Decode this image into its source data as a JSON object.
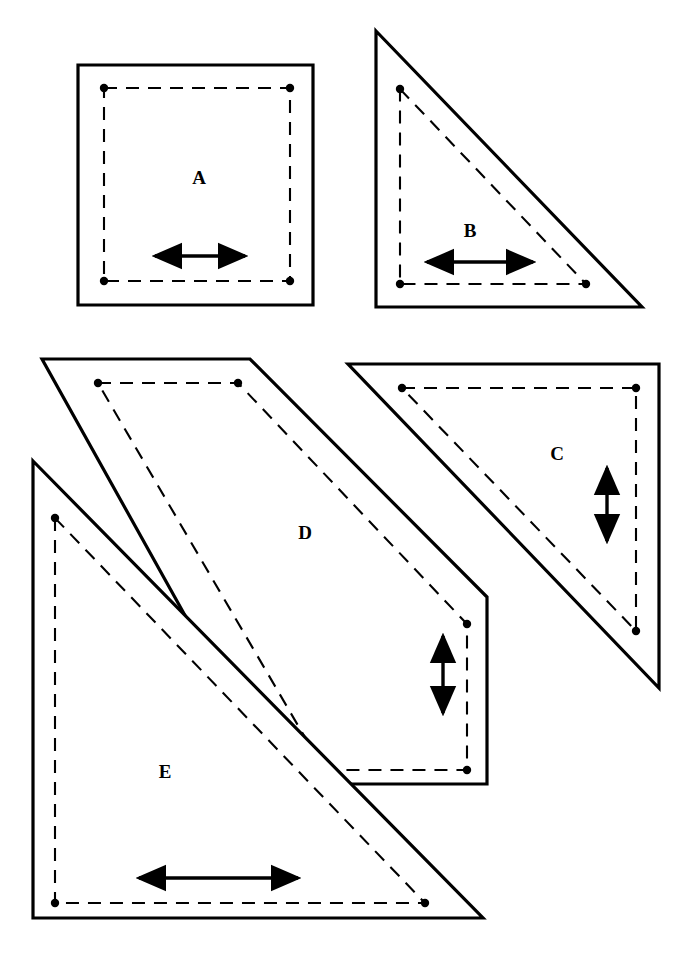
{
  "figure": {
    "background_color": "#ffffff",
    "line_color": "#000000",
    "width": 693,
    "height": 956
  },
  "shapes": [
    {
      "id": "A",
      "label": "A",
      "kind": "square",
      "label_position": {
        "x": 199,
        "y": 180
      },
      "outline_points": "78,65 313,65 313,305 78,305",
      "seam_points": "104,88 290,88 290,281 104,281",
      "seam_dots": [
        {
          "x": 104,
          "y": 88
        },
        {
          "x": 290,
          "y": 88
        },
        {
          "x": 290,
          "y": 281
        },
        {
          "x": 104,
          "y": 281
        }
      ],
      "grain_arrow": {
        "orientation": "horizontal",
        "x1": 155,
        "y1": 256,
        "x2": 245,
        "y2": 256
      }
    },
    {
      "id": "B",
      "label": "B",
      "kind": "right-triangle",
      "label_position": {
        "x": 470,
        "y": 233
      },
      "outline_points": "376,31 642,307 376,307",
      "seam_points": "400,89 586,284 400,284",
      "seam_dots": [
        {
          "x": 400,
          "y": 89
        },
        {
          "x": 586,
          "y": 284
        },
        {
          "x": 400,
          "y": 284
        }
      ],
      "grain_arrow": {
        "orientation": "horizontal",
        "x1": 427,
        "y1": 262,
        "x2": 533,
        "y2": 262
      }
    },
    {
      "id": "C",
      "label": "C",
      "kind": "right-triangle",
      "label_position": {
        "x": 557,
        "y": 456
      },
      "outline_points": "348,364 659,364 659,688",
      "seam_points": "402,388 636,388 636,631",
      "seam_dots": [
        {
          "x": 402,
          "y": 388
        },
        {
          "x": 636,
          "y": 388
        },
        {
          "x": 636,
          "y": 631
        }
      ],
      "grain_arrow": {
        "orientation": "vertical",
        "x1": 607,
        "y1": 468,
        "x2": 607,
        "y2": 541
      }
    },
    {
      "id": "D",
      "label": "D",
      "kind": "parallelogram",
      "label_position": {
        "x": 305,
        "y": 535
      },
      "outline_points": "42,359 250,359 487,597 487,784 279,784",
      "seam_points": "98,383 238,383 467,624 467,770 324,770",
      "seam_dots": [
        {
          "x": 98,
          "y": 383
        },
        {
          "x": 238,
          "y": 383
        },
        {
          "x": 467,
          "y": 624
        },
        {
          "x": 467,
          "y": 770
        }
      ],
      "grain_arrow": {
        "orientation": "vertical",
        "x1": 443,
        "y1": 636,
        "x2": 443,
        "y2": 713
      }
    },
    {
      "id": "E",
      "label": "E",
      "kind": "right-triangle",
      "label_position": {
        "x": 165,
        "y": 774
      },
      "outline_points": "33,461 483,918 33,918",
      "seam_points": "55,518 425,903 55,903",
      "seam_dots": [
        {
          "x": 55,
          "y": 518
        },
        {
          "x": 425,
          "y": 903
        },
        {
          "x": 55,
          "y": 903
        }
      ],
      "grain_arrow": {
        "orientation": "horizontal",
        "x1": 139,
        "y1": 878,
        "x2": 298,
        "y2": 878
      }
    }
  ]
}
